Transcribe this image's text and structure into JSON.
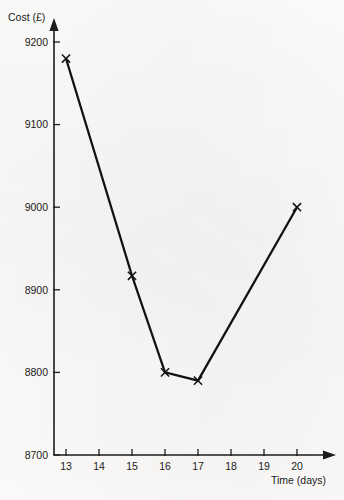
{
  "chart_data": {
    "type": "line",
    "title": "",
    "xlabel": "Time (days)",
    "ylabel": "Cost (£)",
    "x": [
      13,
      15,
      16,
      17,
      20
    ],
    "values": [
      9180,
      8917,
      8800,
      8790,
      9000
    ],
    "series": [
      {
        "name": "Cost",
        "points": [
          {
            "x": 13,
            "y": 9180
          },
          {
            "x": 15,
            "y": 8917
          },
          {
            "x": 16,
            "y": 8800
          },
          {
            "x": 17,
            "y": 8790
          },
          {
            "x": 20,
            "y": 9000
          }
        ]
      }
    ],
    "xlim": [
      12.6,
      20.8
    ],
    "ylim": [
      8700,
      9240
    ],
    "xticks": [
      13,
      14,
      15,
      16,
      17,
      18,
      19,
      20
    ],
    "xtick_labels": [
      "13",
      "14",
      "15",
      "16",
      "17",
      "18",
      "19",
      "20"
    ],
    "yticks": [
      8700,
      8800,
      8900,
      9000,
      9100,
      9200
    ],
    "ytick_labels": [
      "8700",
      "8800",
      "8900",
      "9000",
      "9100",
      "9200"
    ],
    "grid": false,
    "legend": false,
    "legend_position": "none",
    "marker": "x",
    "line_color": "#121212",
    "axis_color": "#1c1c1c",
    "background_color": "#fbfbf9",
    "x_axis_has_arrow": true,
    "y_axis_has_arrow": true
  },
  "axis_titles": {
    "y": "Cost (£)",
    "x": "Time (days)"
  }
}
